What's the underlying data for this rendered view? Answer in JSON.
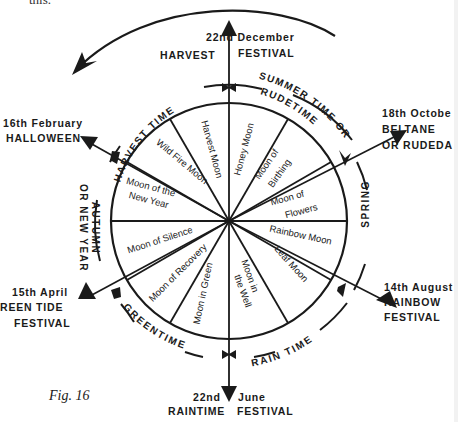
{
  "figure": {
    "caption": "Fig. 16",
    "top_text_fragment": "this.",
    "stroke_color": "#1a1a1a",
    "background": "#ffffff"
  },
  "festivals": [
    {
      "id": "top",
      "date": "22nd December",
      "name_left": "HARVEST",
      "name_right": "FESTIVAL"
    },
    {
      "id": "upper-right",
      "date": "18th Octobe",
      "line2": "BELTANE",
      "line3": "OR RUDEDA"
    },
    {
      "id": "lower-right",
      "date": "14th August",
      "line2": "RAINBOW",
      "line3": "FESTIVAL"
    },
    {
      "id": "bottom",
      "date_left": "22nd",
      "date_right": "June",
      "name_left": "RAINTIME",
      "name_right": "FESTIVAL"
    },
    {
      "id": "lower-left",
      "date": "15th April",
      "line2": "REEN TIDE",
      "line3": "FESTIVAL"
    },
    {
      "id": "upper-left",
      "date": "16th February",
      "line2": "HALLOWEEN"
    }
  ],
  "seasons": [
    {
      "id": "harvest-time",
      "label": "HARVEST TIME"
    },
    {
      "id": "summer-time",
      "label": "SUMMER TIME OR",
      "label2": "RUDETIME"
    },
    {
      "id": "spring",
      "label": "SPRING"
    },
    {
      "id": "rain-time",
      "label": "RAIN TIME"
    },
    {
      "id": "greentime",
      "label": "GREENTIME"
    },
    {
      "id": "autumn",
      "label": "AUTUMN",
      "label2": "OR NEW YEAR"
    }
  ],
  "moons": [
    {
      "label": "Honey Moon"
    },
    {
      "label": "Moon of",
      "label2": "Birthing"
    },
    {
      "label": "Moon of",
      "label2": "Flowers"
    },
    {
      "label": "Rainbow Moon"
    },
    {
      "label": "Leaf Moon"
    },
    {
      "label": "Moon in",
      "label2": "the Well"
    },
    {
      "label": "Moon in Green"
    },
    {
      "label": "Moon of Recovery"
    },
    {
      "label": "Moon of Silence"
    },
    {
      "label": "Moon of the",
      "label2": "New Year"
    },
    {
      "label": "Wild Fire Moon"
    },
    {
      "label": "Harvest Moon"
    }
  ]
}
